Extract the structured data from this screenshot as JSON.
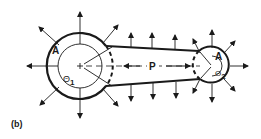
{
  "figure": {
    "caption": "(b)",
    "ink_color": "#1a1a1a",
    "background": "#ffffff"
  },
  "large_pulley": {
    "area_label": "A",
    "angle_label": "Θ1",
    "angle_symbol": "Θ",
    "angle_subscript": "1"
  },
  "small_pulley": {
    "area_label": "A",
    "angle_label": "Θ2",
    "angle_symbol": "Θ",
    "angle_subscript": "2"
  },
  "belt": {
    "force_label": "P"
  }
}
